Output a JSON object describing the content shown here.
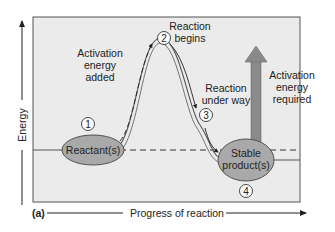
{
  "figure": {
    "panel_label": "(a)",
    "x_axis_label": "Progress of reaction",
    "y_axis_label": "Energy",
    "colors": {
      "panel_background": "#ebebeb",
      "panel_border": "#555555",
      "ellipse_fill": "#a9a9a9",
      "arrow_fill": "#8a8a8a",
      "curve": "#555555"
    }
  },
  "steps": [
    {
      "number": "1",
      "label": "Reactant(s)"
    },
    {
      "number": "2",
      "label": "Reaction begins"
    },
    {
      "number": "3",
      "label": "Reaction under way"
    },
    {
      "number": "4",
      "label": "Stable product(s)"
    }
  ],
  "annotations": {
    "activation_added": [
      "Activation",
      "energy",
      "added"
    ],
    "reaction_begins": [
      "Reaction",
      "begins"
    ],
    "under_way": [
      "Reaction",
      "under way"
    ],
    "activation_required": [
      "Activation",
      "energy",
      "required"
    ],
    "reactant": "Reactant(s)",
    "product": [
      "Stable",
      "product(s)"
    ]
  }
}
